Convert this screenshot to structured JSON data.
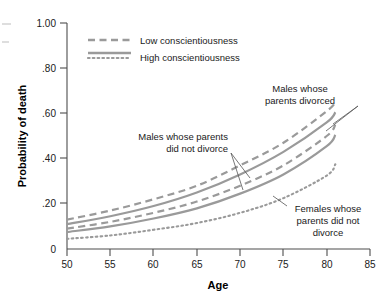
{
  "chart_data": {
    "type": "line",
    "title": "",
    "xlabel": "Age",
    "ylabel": "Probability of death",
    "xlim": [
      50,
      85
    ],
    "ylim": [
      0,
      1.0
    ],
    "grid": false,
    "legend_position": "top-left-inside",
    "x_ticks": [
      "50",
      "55",
      "60",
      "65",
      "70",
      "75",
      "80",
      "85"
    ],
    "x_tick_values": [
      50,
      55,
      60,
      65,
      70,
      75,
      80,
      85
    ],
    "y_ticks": [
      "0",
      ".20",
      ".40",
      ".60",
      ".80",
      "1.00"
    ],
    "y_tick_values": [
      0,
      0.2,
      0.4,
      0.6,
      0.8,
      1.0
    ],
    "legend": [
      {
        "label": "Low conscientiousness",
        "style": "dashed"
      },
      {
        "label": "High conscientiousness",
        "style": "solid"
      },
      {
        "label": "",
        "style": "dotted"
      }
    ],
    "x": [
      50,
      55,
      60,
      65,
      70,
      75,
      80,
      81
    ],
    "series": [
      {
        "name": "Males whose parents divorced — Low conscientiousness",
        "group": "Males whose parents divorced",
        "style": "dashed",
        "values": [
          0.13,
          0.17,
          0.22,
          0.28,
          0.37,
          0.47,
          0.61,
          0.65
        ]
      },
      {
        "name": "Males whose parents divorced — High conscientiousness",
        "group": "Males whose parents divorced",
        "style": "solid",
        "values": [
          0.11,
          0.145,
          0.19,
          0.25,
          0.33,
          0.43,
          0.56,
          0.605
        ]
      },
      {
        "name": "Males whose parents did not divorce — Low conscientiousness",
        "group": "Males whose parents did not divorce",
        "style": "dashed",
        "values": [
          0.09,
          0.12,
          0.16,
          0.21,
          0.28,
          0.37,
          0.5,
          0.55
        ]
      },
      {
        "name": "Males whose parents did not divorce — High conscientiousness",
        "group": "Males whose parents did not divorce",
        "style": "solid",
        "values": [
          0.075,
          0.1,
          0.135,
          0.18,
          0.245,
          0.33,
          0.455,
          0.505
        ]
      },
      {
        "name": "Females whose parents did not divorce",
        "group": "Females whose parents did not divorce",
        "style": "dotted",
        "values": [
          0.045,
          0.06,
          0.085,
          0.115,
          0.16,
          0.225,
          0.325,
          0.375
        ]
      }
    ],
    "annotations": [
      {
        "id": "males-divorced",
        "lines": [
          "Males whose",
          "parents divorced"
        ],
        "points_to": [
          "Males whose parents divorced — Low conscientiousness",
          "Males whose parents divorced — High conscientiousness"
        ]
      },
      {
        "id": "males-not-divorced",
        "lines": [
          "Males whose parents",
          "did not divorce"
        ],
        "points_to": [
          "Males whose parents did not divorce — Low conscientiousness",
          "Males whose parents did not divorce — High conscientiousness"
        ]
      },
      {
        "id": "females-not-divorced",
        "lines": [
          "Females whose",
          "parents did not",
          "divorce"
        ],
        "points_to": [
          "Females whose parents did not divorce"
        ]
      }
    ]
  },
  "labels": {
    "y_axis_title": "Probability of death",
    "x_axis_title": "Age",
    "y_tick_0": "0",
    "y_tick_1": ".20",
    "y_tick_2": ".40",
    "y_tick_3": ".60",
    "y_tick_4": ".80",
    "y_tick_5": "1.00",
    "x_tick_0": "50",
    "x_tick_1": "55",
    "x_tick_2": "60",
    "x_tick_3": "65",
    "x_tick_4": "70",
    "x_tick_5": "75",
    "x_tick_6": "80",
    "x_tick_7": "85",
    "legend_low": "Low conscientiousness",
    "legend_high": "High conscientiousness",
    "annot_md_l1": "Males whose",
    "annot_md_l2": "parents divorced",
    "annot_mnd_l1": "Males whose parents",
    "annot_mnd_l2": "did not divorce",
    "annot_fnd_l1": "Females whose",
    "annot_fnd_l2": "parents did not",
    "annot_fnd_l3": "divorce"
  },
  "colors": {
    "curve": "#9a9a9a",
    "axis": "#4d4d4d",
    "text": "#1a1a1a",
    "background": "#ffffff"
  }
}
